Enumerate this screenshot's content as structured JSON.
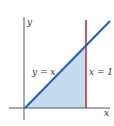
{
  "diagram": {
    "type": "region-plot",
    "axes": {
      "x_label": "x",
      "y_label": "y"
    },
    "curves": [
      {
        "name": "y = x",
        "label": "y = x",
        "color": "#2a5caa"
      },
      {
        "name": "x = 1",
        "label": "x = 1",
        "color": "#b0243a"
      }
    ],
    "region": {
      "description": "area under y = x from x = 0 to x = 1",
      "fill": "#c5dcee"
    },
    "colors": {
      "axis": "#555555",
      "line_yx": "#2a5caa",
      "line_x1": "#b0243a",
      "shade": "#c5dcee"
    }
  }
}
